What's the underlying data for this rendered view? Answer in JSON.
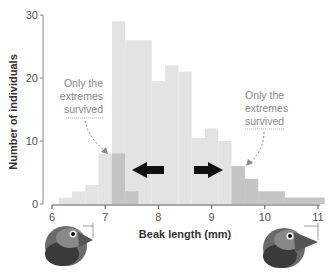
{
  "chart_data": {
    "type": "bar",
    "title": "",
    "xlabel": "Beak length (mm)",
    "ylabel": "Number of individuals",
    "xlim": [
      6,
      11
    ],
    "ylim": [
      0,
      30
    ],
    "x_ticks": [
      "6",
      "7",
      "8",
      "9",
      "10",
      "11"
    ],
    "y_ticks": [
      "0",
      "10",
      "20",
      "30"
    ],
    "bin_width": 0.25,
    "grid": false,
    "series": [
      {
        "name": "Original population",
        "color": "#e3e3e3",
        "bins": [
          {
            "x0": 6.125,
            "x1": 6.375,
            "value": 1
          },
          {
            "x0": 6.375,
            "x1": 6.625,
            "value": 2
          },
          {
            "x0": 6.625,
            "x1": 6.875,
            "value": 3
          },
          {
            "x0": 6.875,
            "x1": 7.125,
            "value": 8
          },
          {
            "x0": 7.125,
            "x1": 7.375,
            "value": 29
          },
          {
            "x0": 7.375,
            "x1": 7.875,
            "value": 26
          },
          {
            "x0": 7.875,
            "x1": 8.125,
            "value": 19.5
          },
          {
            "x0": 8.125,
            "x1": 8.375,
            "value": 22
          },
          {
            "x0": 8.375,
            "x1": 8.625,
            "value": 21
          },
          {
            "x0": 8.625,
            "x1": 8.875,
            "value": 10.5
          },
          {
            "x0": 8.875,
            "x1": 9.125,
            "value": 12
          },
          {
            "x0": 9.125,
            "x1": 9.375,
            "value": 10
          },
          {
            "x0": 9.375,
            "x1": 9.625,
            "value": 6
          },
          {
            "x0": 9.625,
            "x1": 9.875,
            "value": 4
          },
          {
            "x0": 9.875,
            "x1": 10.375,
            "value": 2
          },
          {
            "x0": 10.375,
            "x1": 11.125,
            "value": 1
          }
        ]
      },
      {
        "name": "Survivors",
        "color": "#c4c4c4",
        "bins": [
          {
            "x0": 7.125,
            "x1": 7.375,
            "value": 8
          },
          {
            "x0": 7.375,
            "x1": 7.625,
            "value": 2
          },
          {
            "x0": 9.375,
            "x1": 9.625,
            "value": 6
          },
          {
            "x0": 9.625,
            "x1": 9.875,
            "value": 4
          },
          {
            "x0": 9.875,
            "x1": 10.375,
            "value": 2
          },
          {
            "x0": 10.375,
            "x1": 11.125,
            "value": 1
          }
        ]
      }
    ],
    "annotations": [
      {
        "text": [
          "Only the",
          "extremes",
          "survived"
        ],
        "side": "left"
      },
      {
        "text": [
          "Only the",
          "extremes",
          "survived"
        ],
        "side": "right"
      }
    ],
    "arrows": [
      {
        "direction": "left",
        "at_x": 7.85
      },
      {
        "direction": "right",
        "at_x": 9.1
      }
    ]
  },
  "illustrations": {
    "left_bird": "small-beak-finch",
    "right_bird": "large-beak-finch"
  }
}
